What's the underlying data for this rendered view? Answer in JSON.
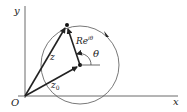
{
  "diagram": {
    "axes": {
      "x_label": "x",
      "y_label": "y",
      "origin_label": "O"
    },
    "vectors": {
      "z_label": "z",
      "z0_label": "z",
      "z0_sub": "0",
      "radius_label_base": "Re",
      "radius_label_sup": "iθ"
    },
    "angle_label": "θ",
    "colors": {
      "stroke": "#222222",
      "circle": "#555555"
    }
  }
}
